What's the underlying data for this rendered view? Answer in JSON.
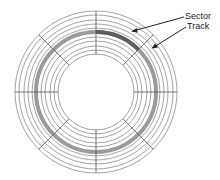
{
  "diagram": {
    "labels": {
      "sector": "Sector",
      "track": "Track"
    },
    "colors": {
      "ring_line": "#8a8a8a",
      "sector_line": "#555555",
      "track_band": "#9a9a9a",
      "sector_highlight": "#5e5e5e",
      "arrow": "#222222"
    },
    "geometry": {
      "center": [
        96,
        92
      ],
      "ring_radii": [
        81,
        77,
        72,
        68,
        64,
        60,
        55,
        51,
        46,
        42,
        38
      ],
      "highlighted_track_radius": 60,
      "sector_count": 8,
      "highlighted_sector_deg": [
        45,
        90
      ]
    }
  }
}
